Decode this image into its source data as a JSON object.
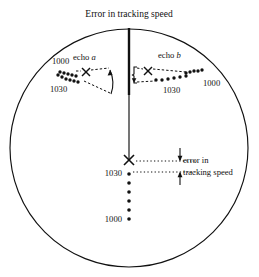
{
  "figure": {
    "title": "Error in tracking speed",
    "type": "polar-tracking-diagram",
    "background_color": "#ffffff",
    "stroke_color": "#111111",
    "circle": {
      "cx": 129,
      "cy": 148,
      "r": 119
    }
  },
  "echo_a": {
    "label_prefix": "echo ",
    "label_italic": "a",
    "speed_high": "1000",
    "speed_low": "1030",
    "marker": "x-marker",
    "marker_x": 86,
    "marker_y": 72,
    "track_upper": [
      [
        60,
        72
      ],
      [
        64,
        73
      ],
      [
        68,
        74
      ],
      [
        72,
        75
      ],
      [
        76,
        76
      ]
    ],
    "track_lower": [
      [
        58,
        75
      ],
      [
        62,
        77
      ],
      [
        66,
        79
      ],
      [
        70,
        80
      ],
      [
        74,
        81
      ],
      [
        78,
        82
      ]
    ],
    "dashed_upper": [
      [
        88,
        71
      ],
      [
        108,
        69
      ]
    ],
    "dashed_lower": [
      [
        92,
        79
      ],
      [
        110,
        92
      ]
    ],
    "arrow_from": [
      111,
      93
    ],
    "arrow_to": [
      110,
      70
    ]
  },
  "echo_b": {
    "label_prefix": "echo ",
    "label_italic": "b",
    "speed_high": "1000",
    "speed_low": "1030",
    "marker": "x-marker",
    "marker_x": 148,
    "marker_y": 71,
    "track_upper": [
      [
        186,
        73
      ],
      [
        190,
        72
      ],
      [
        194,
        71
      ],
      [
        198,
        71
      ],
      [
        202,
        70
      ]
    ],
    "track_lower": [
      [
        156,
        80
      ],
      [
        162,
        80
      ],
      [
        168,
        79
      ],
      [
        174,
        78
      ],
      [
        180,
        77
      ],
      [
        186,
        76
      ]
    ],
    "dashed_upper": [
      [
        136,
        69
      ],
      [
        146,
        69
      ]
    ],
    "dashed_lower": [
      [
        136,
        82
      ],
      [
        152,
        81
      ]
    ],
    "bracket_x": 136,
    "bracket_top": 68,
    "bracket_bottom": 84
  },
  "center_track": {
    "speed_high": "1000",
    "speed_low": "1030",
    "marker": "x-marker",
    "marker_x": 129,
    "marker_y": 160,
    "dots": [
      [
        129,
        174
      ],
      [
        129,
        183
      ],
      [
        129,
        192
      ],
      [
        129,
        201
      ],
      [
        129,
        210
      ],
      [
        129,
        219
      ]
    ]
  },
  "error_annotation": {
    "line_1": "error in",
    "line_2": "tracking speed",
    "dotted_upper": [
      [
        134,
        161
      ],
      [
        198,
        161
      ]
    ],
    "dotted_lower": [
      [
        134,
        172
      ],
      [
        198,
        172
      ]
    ],
    "arrow_down_x": 180,
    "arrow_down_from": 150,
    "arrow_down_to": 162,
    "arrow_up_x": 180,
    "arrow_up_from": 183,
    "arrow_up_to": 171
  },
  "axis_line": {
    "name": "vertical-reference-line",
    "top": 28,
    "bottom": 158,
    "x": 129,
    "thick_until": 95
  }
}
